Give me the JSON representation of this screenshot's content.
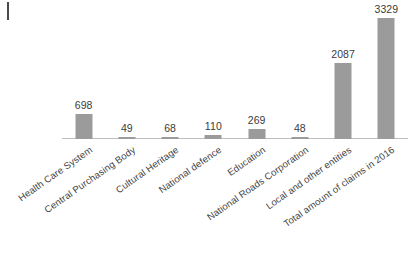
{
  "chart_data": {
    "type": "bar",
    "title": "",
    "subtitle": "",
    "xlabel": "",
    "ylabel": "",
    "grid": false,
    "legend": "none",
    "ylim": [
      0,
      3600
    ],
    "bar_color": "#9b9b9b",
    "axis_color": "#bdbdbd",
    "label_color": "#3f3f3f",
    "value_label_color": "#3b3b3b",
    "categories": [
      "Health Care System",
      "Central Purchasing Body",
      "Cultural Heritage",
      "National defence",
      "Education",
      "National Roads Corporation",
      "Local and other entities",
      "Total amount of claims in 2016"
    ],
    "values": [
      698,
      49,
      68,
      110,
      269,
      48,
      2087,
      3329
    ],
    "value_labels": [
      "698",
      "49",
      "68",
      "110",
      "269",
      "48",
      "2087",
      "3329"
    ]
  }
}
